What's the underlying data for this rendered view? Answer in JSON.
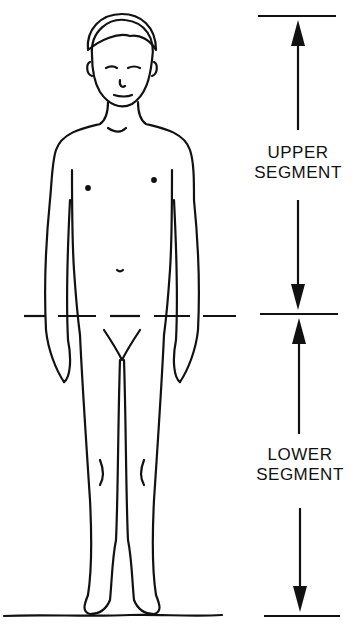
{
  "diagram": {
    "upper_label_line1": "UPPER",
    "upper_label_line2": "SEGMENT",
    "lower_label_line1": "LOWER",
    "lower_label_line2": "SEGMENT",
    "colors": {
      "ink": "#111111",
      "background": "#ffffff"
    }
  }
}
